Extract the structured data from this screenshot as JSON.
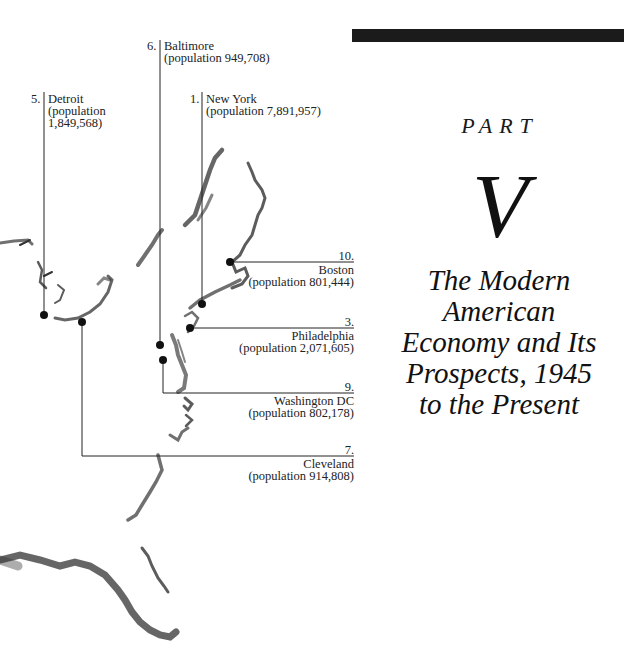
{
  "header": {
    "part_label": "PART",
    "part_number": "V",
    "title_lines": [
      "The Modern",
      "American",
      "Economy and Its",
      "Prospects, 1945",
      "to the Present"
    ]
  },
  "map": {
    "cities": [
      {
        "rank": "1.",
        "name": "New York",
        "population": "(population 7,891,957)"
      },
      {
        "rank": "3.",
        "name": "Philadelphia",
        "population": "(population 2,071,605)"
      },
      {
        "rank": "5.",
        "name": "Detroit",
        "population_line1": "(population",
        "population_line2": "1,849,568)"
      },
      {
        "rank": "6.",
        "name": "Baltimore",
        "population": "(population 949,708)"
      },
      {
        "rank": "7.",
        "name": "Cleveland",
        "population": "(population 914,808)"
      },
      {
        "rank": "9.",
        "name": "Washington DC",
        "population": "(population 802,178)"
      },
      {
        "rank": "10.",
        "name": "Boston",
        "population": "(population 801,444)"
      }
    ]
  },
  "colors": {
    "ink": "#1a1a1a",
    "bar": "#1b1b1b",
    "background": "#ffffff"
  }
}
